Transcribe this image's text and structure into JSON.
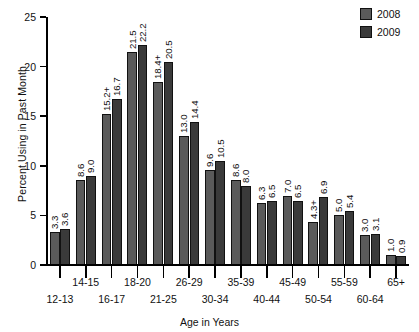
{
  "chart_data": {
    "type": "bar",
    "title": "",
    "xlabel": "Age in Years",
    "ylabel": "Percent Using in Past Month",
    "ylim": [
      0,
      25
    ],
    "yticks": [
      0,
      5,
      10,
      15,
      20,
      25
    ],
    "ytick_labels": [
      "0",
      "5",
      "10",
      "15",
      "20",
      "25"
    ],
    "grid": false,
    "legend_position": "top-right",
    "categories": [
      "12-13",
      "14-15",
      "16-17",
      "18-20",
      "21-25",
      "26-29",
      "30-34",
      "35-39",
      "40-44",
      "45-49",
      "50-54",
      "55-59",
      "60-64",
      "65+"
    ],
    "series": [
      {
        "name": "2008",
        "color": "#5a5a5a",
        "values": [
          3.3,
          8.6,
          15.2,
          21.5,
          18.4,
          13.0,
          9.6,
          8.6,
          6.3,
          7.0,
          4.3,
          5.0,
          3.0,
          1.0
        ],
        "labels": [
          "3.3",
          "8.6",
          "15.2+",
          "21.5",
          "18.4+",
          "13.0",
          "9.6",
          "8.6",
          "6.3",
          "7.0",
          "4.3+",
          "5.0",
          "3.0",
          "1.0"
        ]
      },
      {
        "name": "2009",
        "color": "#3a3a3a",
        "values": [
          3.6,
          9.0,
          16.7,
          22.2,
          20.5,
          14.4,
          10.5,
          8.0,
          6.5,
          6.5,
          6.9,
          5.4,
          3.1,
          0.9
        ],
        "labels": [
          "3.6",
          "9.0",
          "16.7",
          "22.2",
          "20.5",
          "14.4",
          "10.5",
          "8.0",
          "6.5",
          "6.5",
          "6.9",
          "5.4",
          "3.1",
          "0.9"
        ]
      }
    ],
    "annotations": [
      "+ Difference between this estimate and the 2009 estimate is statistically significant"
    ]
  },
  "legend": {
    "items": [
      {
        "label": "2008"
      },
      {
        "label": "2009"
      }
    ]
  }
}
